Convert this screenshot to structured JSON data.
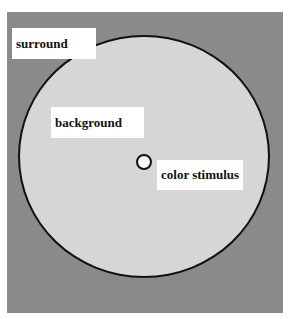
{
  "diagram": {
    "labels": {
      "surround": "surround",
      "background": "background",
      "stimulus": "color stimulus"
    },
    "colors": {
      "surround": "#8a8a8a",
      "background": "#d6d6d6",
      "stimulus": "#fafafa",
      "outline": "#111111"
    }
  }
}
